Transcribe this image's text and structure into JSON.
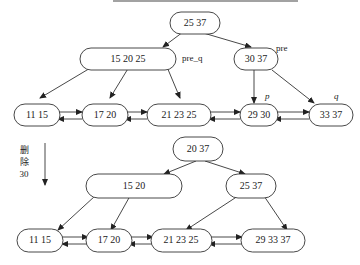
{
  "diagram": {
    "type": "b-plus-tree-deletion",
    "top_caption_cutoff": "(partially visible caption text at top edge)",
    "operation_label": {
      "line1": "删",
      "line2": "除",
      "line3": "30"
    },
    "before": {
      "root": {
        "keys": "25  37"
      },
      "internal": [
        {
          "id": "pre_q",
          "keys": "15  20  25",
          "label": "pre_q"
        },
        {
          "id": "pre",
          "keys": "30  37",
          "label": "pre"
        }
      ],
      "leaves": [
        {
          "keys": "11  15"
        },
        {
          "keys": "17  20"
        },
        {
          "keys": "21  23  25"
        },
        {
          "keys": "29  30",
          "label": "p"
        },
        {
          "keys": "33  37",
          "label": "q"
        }
      ]
    },
    "after": {
      "root": {
        "keys": "20  37"
      },
      "internal": [
        {
          "keys": "15  20"
        },
        {
          "keys": "25  37"
        }
      ],
      "leaves": [
        {
          "keys": "11  15"
        },
        {
          "keys": "17  20"
        },
        {
          "keys": "21  23  25"
        },
        {
          "keys": "29  33  37"
        }
      ]
    }
  }
}
